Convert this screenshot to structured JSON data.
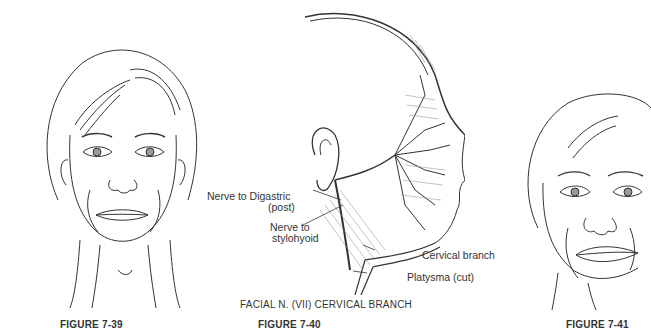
{
  "figures": [
    {
      "caption": "FIGURE 7-39"
    },
    {
      "caption": "FIGURE 7-40",
      "title": "FACIAL N. (VII) CERVICAL BRANCH",
      "labels": {
        "digastric_1": "Nerve to Digastric",
        "digastric_2": "(post)",
        "stylohyoid_1": "Nerve to",
        "stylohyoid_2": "stylohyoid",
        "cervical": "Cervical branch",
        "platysma": "Platysma (cut)"
      }
    },
    {
      "caption": "FIGURE 7-41"
    }
  ]
}
